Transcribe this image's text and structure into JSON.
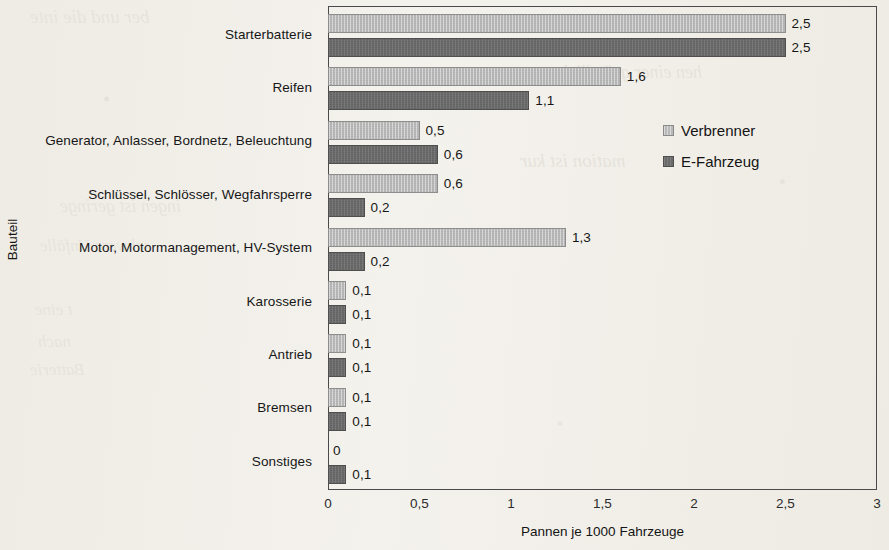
{
  "figure": {
    "y_axis_title": "Bauteil",
    "x_axis_title": "Pannen je 1000 Fahrzeuge"
  },
  "legend": {
    "items": [
      {
        "name": "Verbrenner",
        "key": "verbrenner",
        "color": "#b9b9b9"
      },
      {
        "name": "E-Fahrzeug",
        "key": "efahrzeug",
        "color": "#6b6b6b"
      }
    ]
  },
  "x_ticks": [
    "0",
    "0,5",
    "1",
    "1,5",
    "2",
    "2,5",
    "3"
  ],
  "value_labels": {
    "starterbatterie": {
      "verbrenner": "2,5",
      "efahrzeug": "2,5"
    },
    "reifen": {
      "verbrenner": "1,6",
      "efahrzeug": "1,1"
    },
    "generator": {
      "verbrenner": "0,5",
      "efahrzeug": "0,6"
    },
    "schluessel": {
      "verbrenner": "0,6",
      "efahrzeug": "0,2"
    },
    "motor": {
      "verbrenner": "1,3",
      "efahrzeug": "0,2"
    },
    "karosserie": {
      "verbrenner": "0,1",
      "efahrzeug": "0,1"
    },
    "antrieb": {
      "verbrenner": "0,1",
      "efahrzeug": "0,1"
    },
    "bremsen": {
      "verbrenner": "0,1",
      "efahrzeug": "0,1"
    },
    "sonstiges": {
      "verbrenner": "0",
      "efahrzeug": "0,1"
    }
  },
  "scan_bleed": [
    {
      "text": "ber und die inte",
      "x": 30,
      "y": 6,
      "size": 19
    },
    {
      "text": "hen einer gründlich",
      "x": 560,
      "y": 62,
      "size": 18
    },
    {
      "text": "mation ist kur",
      "x": 520,
      "y": 150,
      "size": 19
    },
    {
      "text": "ingen ist geringe",
      "x": 60,
      "y": 196,
      "size": 18
    },
    {
      "text": "schwere Unfälle",
      "x": 40,
      "y": 236,
      "size": 17
    },
    {
      "text": "t eine",
      "x": 35,
      "y": 300,
      "size": 17
    },
    {
      "text": "nach",
      "x": 38,
      "y": 332,
      "size": 17
    },
    {
      "text": "Batterie",
      "x": 30,
      "y": 360,
      "size": 17
    }
  ],
  "chart_data": {
    "type": "bar",
    "orientation": "horizontal",
    "title": "",
    "xlabel": "Pannen je 1000 Fahrzeuge",
    "ylabel": "Bauteil",
    "xlim": [
      0,
      3
    ],
    "xticks": [
      0,
      0.5,
      1,
      1.5,
      2,
      2.5,
      3
    ],
    "grid": false,
    "legend_position": "inside-right",
    "decimal_separator": ",",
    "categories": [
      "Starterbatterie",
      "Reifen",
      "Generator, Anlasser, Bordnetz, Beleuchtung",
      "Schlüssel, Schlösser, Wegfahrsperre",
      "Motor, Motormanagement, HV-System",
      "Karosserie",
      "Antrieb",
      "Bremsen",
      "Sonstiges"
    ],
    "series": [
      {
        "name": "Verbrenner",
        "color": "#b9b9b9",
        "values": [
          2.5,
          1.6,
          0.5,
          0.6,
          1.3,
          0.1,
          0.1,
          0.1,
          0
        ]
      },
      {
        "name": "E-Fahrzeug",
        "color": "#6b6b6b",
        "values": [
          2.5,
          1.1,
          0.6,
          0.2,
          0.2,
          0.1,
          0.1,
          0.1,
          0.1
        ]
      }
    ]
  }
}
